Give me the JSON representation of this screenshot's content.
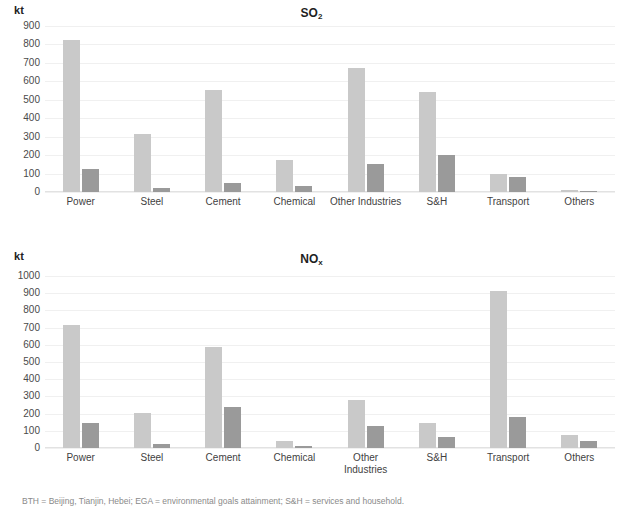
{
  "figure": {
    "unit_label": "kt",
    "footnote": "BTH = Beijing, Tianjin, Hebei; EGA = environmental goals attainment; S&H = services and household."
  },
  "chart_data": [
    {
      "type": "bar",
      "title": "SO2",
      "title_main": "SO",
      "title_sub": "2",
      "xlabel": "",
      "ylabel": "kt",
      "ylim": [
        0,
        900
      ],
      "ytick_step": 100,
      "yticks": [
        900,
        800,
        700,
        600,
        500,
        400,
        300,
        200,
        100,
        0
      ],
      "grid": true,
      "legend": "none",
      "categories": [
        "Power",
        "Steel",
        "Cement",
        "Chemical",
        "Other Industries",
        "S&H",
        "Transport",
        "Others"
      ],
      "series": [
        {
          "name": "series-1",
          "color": "#c9c9c9",
          "values": [
            825,
            315,
            555,
            172,
            670,
            540,
            95,
            10
          ]
        },
        {
          "name": "series-2",
          "color": "#9a9a9a",
          "values": [
            125,
            22,
            48,
            35,
            152,
            198,
            80,
            8
          ]
        }
      ]
    },
    {
      "type": "bar",
      "title": "NOx",
      "title_main": "NO",
      "title_sub": "x",
      "xlabel": "",
      "ylabel": "kt",
      "ylim": [
        0,
        1000
      ],
      "ytick_step": 100,
      "yticks": [
        1000,
        900,
        800,
        700,
        600,
        500,
        400,
        300,
        200,
        100,
        0
      ],
      "grid": true,
      "legend": "none",
      "categories": [
        "Power",
        "Steel",
        "Cement",
        "Chemical",
        "Other\nIndustries",
        "S&H",
        "Transport",
        "Others"
      ],
      "series": [
        {
          "name": "series-1",
          "color": "#c9c9c9",
          "values": [
            715,
            205,
            590,
            38,
            280,
            148,
            915,
            78
          ]
        },
        {
          "name": "series-2",
          "color": "#9a9a9a",
          "values": [
            143,
            25,
            240,
            10,
            130,
            62,
            180,
            38
          ]
        }
      ]
    }
  ]
}
